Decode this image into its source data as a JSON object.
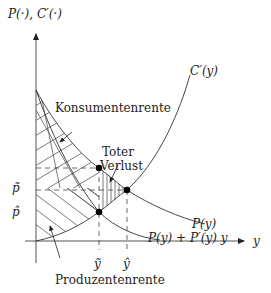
{
  "diagram": {
    "axes": {
      "y_label": "P(·), C′(·)",
      "x_label": "y"
    },
    "curves": {
      "marginal_cost": "C′(y)",
      "demand": "P(y)",
      "marginal_revenue": "P(y) + P′(y) y"
    },
    "ticks": {
      "p_tilde": "p̃",
      "p_hat": "p̂",
      "y_tilde": "ỹ",
      "y_hat": "ŷ"
    },
    "areas": {
      "consumer_surplus": "Konsumentenrente",
      "deadweight_loss_line1": "Toter",
      "deadweight_loss_line2": "Verlust",
      "producer_surplus": "Produzentenrente"
    },
    "colors": {
      "line": "#333333",
      "axis": "#555555",
      "point": "#000000"
    }
  }
}
